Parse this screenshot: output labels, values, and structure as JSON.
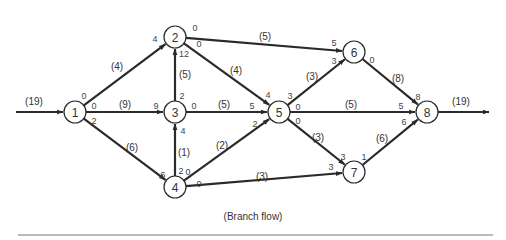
{
  "caption": "(Branch flow)",
  "source_flow": "(19)",
  "sink_flow": "(19)",
  "nodes": [
    {
      "id": "1",
      "x": 75,
      "y": 112
    },
    {
      "id": "2",
      "x": 175,
      "y": 37
    },
    {
      "id": "3",
      "x": 175,
      "y": 112
    },
    {
      "id": "4",
      "x": 175,
      "y": 187
    },
    {
      "id": "5",
      "x": 279,
      "y": 112
    },
    {
      "id": "6",
      "x": 354,
      "y": 52
    },
    {
      "id": "7",
      "x": 354,
      "y": 172
    },
    {
      "id": "8",
      "x": 427,
      "y": 112
    }
  ],
  "edges": [
    {
      "from": "1",
      "to": "2",
      "flow": "(4)",
      "start": "0",
      "end": "4"
    },
    {
      "from": "1",
      "to": "3",
      "flow": "(9)",
      "start": "0",
      "end": "9"
    },
    {
      "from": "1",
      "to": "4",
      "flow": "(6)",
      "start": "2",
      "end": "6"
    },
    {
      "from": "3",
      "to": "2",
      "flow": "(5)",
      "start": "2",
      "end": "12"
    },
    {
      "from": "4",
      "to": "3",
      "flow": "(1)",
      "start": "2",
      "end": "4"
    },
    {
      "from": "2",
      "to": "6",
      "flow": "(5)",
      "start": "0",
      "end": "5"
    },
    {
      "from": "2",
      "to": "5",
      "flow": "(4)",
      "start": "0",
      "end": "4"
    },
    {
      "from": "3",
      "to": "5",
      "flow": "(5)",
      "start": "0",
      "end": "5"
    },
    {
      "from": "4",
      "to": "5",
      "flow": "(2)",
      "start": "0",
      "end": "2"
    },
    {
      "from": "4",
      "to": "7",
      "flow": "(3)",
      "start": "0",
      "end": "3"
    },
    {
      "from": "5",
      "to": "6",
      "flow": "(3)",
      "start": "3",
      "end": "3"
    },
    {
      "from": "5",
      "to": "8",
      "flow": "(5)",
      "start": "0",
      "end": "5"
    },
    {
      "from": "5",
      "to": "7",
      "flow": "(3)",
      "start": "0",
      "end": "3"
    },
    {
      "from": "6",
      "to": "8",
      "flow": "(8)",
      "start": "0",
      "end": "8"
    },
    {
      "from": "7",
      "to": "8",
      "flow": "(6)",
      "start": "1",
      "end": "6"
    }
  ],
  "colors": {
    "line": "#2a2a2a",
    "text": "#333333",
    "rule": "#777777"
  }
}
